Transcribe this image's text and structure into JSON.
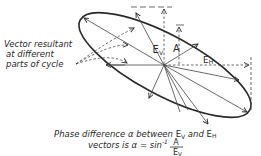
{
  "diagram": {
    "type": "elliptical-polarization",
    "colors": {
      "ink": "#2a2a2a",
      "background": "#ffffff"
    },
    "labels": {
      "vector_resultant": [
        "Vector resultant",
        "at different",
        "parts of cycle"
      ],
      "ev": "E",
      "ev_sub": "V",
      "a": "A",
      "eh": "E",
      "eh_sub": "H"
    },
    "caption": {
      "line1_prefix": "Phase difference α between ",
      "line1_ev": "E",
      "line1_ev_sub": "V",
      "line1_and": " and ",
      "line1_eh": "E",
      "line1_eh_sub": "H",
      "line2_prefix": "vectors is  α = sin",
      "line2_sup": "-1",
      "fraction_num": "A",
      "fraction_den": "E",
      "fraction_den_sub": "V"
    }
  }
}
